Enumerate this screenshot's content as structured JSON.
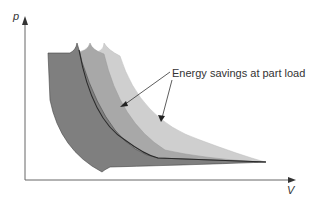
{
  "diagram": {
    "type": "p-V indicator diagram",
    "y_axis_label": "p",
    "x_axis_label": "V",
    "annotation": "Energy savings at part load",
    "regions": [
      {
        "name": "full-load",
        "fill": "#c9c9c9"
      },
      {
        "name": "part-load-1",
        "fill": "#a3a3a3"
      },
      {
        "name": "part-load-2",
        "fill": "#7d7d7d"
      }
    ],
    "colors": {
      "axis": "#555555",
      "outline": "#2a2a2a",
      "arrow": "#333333"
    }
  }
}
